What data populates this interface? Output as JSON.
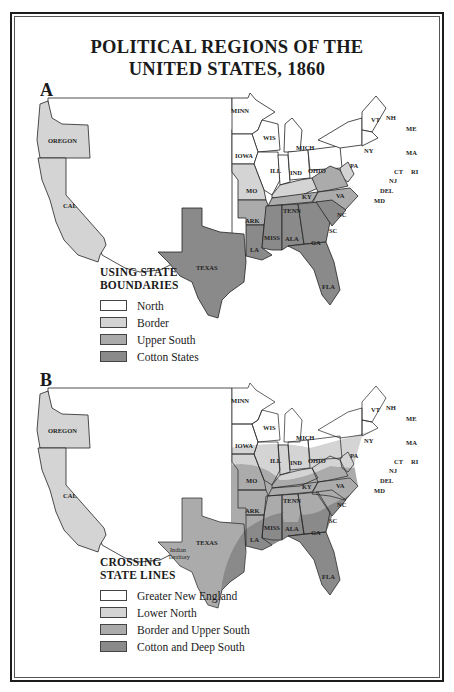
{
  "title": {
    "line1": "POLITICAL REGIONS OF THE",
    "line2": "UNITED STATES, 1860"
  },
  "colors": {
    "north": "#ffffff",
    "border": "#d4d4d4",
    "upper_south": "#ababab",
    "cotton": "#8a8a8a",
    "outline": "#222222",
    "frame": "#1c1c1c"
  },
  "panel_a": {
    "letter": "A",
    "legend": {
      "title_line1": "USING STATE",
      "title_line2": "BOUNDARIES",
      "items": [
        {
          "label": "North",
          "color": "#ffffff"
        },
        {
          "label": "Border",
          "color": "#d4d4d4"
        },
        {
          "label": "Upper South",
          "color": "#ababab"
        },
        {
          "label": "Cotton States",
          "color": "#8a8a8a"
        }
      ]
    },
    "labels": {
      "oregon": "OREGON",
      "cal": "CAL",
      "texas": "TEXAS",
      "minn": "MINN",
      "wis": "WIS",
      "mich": "MICH",
      "iowa": "IOWA",
      "ill": "ILL",
      "ind": "IND",
      "ohio": "OHIO",
      "pa": "PA",
      "ny": "NY",
      "vt": "VT",
      "nh": "NH",
      "me": "ME",
      "ma": "MA",
      "ri": "RI",
      "ct": "CT",
      "nj": "NJ",
      "del": "DEL",
      "md": "MD",
      "mo": "MO",
      "ky": "KY",
      "va": "VA",
      "ark": "ARK",
      "tenn": "TENN",
      "nc": "NC",
      "sc": "SC",
      "la": "LA",
      "miss": "MISS",
      "ala": "ALA",
      "ga": "GA",
      "fla": "FLA"
    }
  },
  "panel_b": {
    "letter": "B",
    "legend": {
      "title_line1": "CROSSING",
      "title_line2": "STATE LINES",
      "items": [
        {
          "label": "Greater New England",
          "color": "#ffffff"
        },
        {
          "label": "Lower North",
          "color": "#d4d4d4"
        },
        {
          "label": "Border and Upper South",
          "color": "#ababab"
        },
        {
          "label": "Cotton and Deep South",
          "color": "#8a8a8a"
        }
      ]
    },
    "labels": {
      "oregon": "OREGON",
      "cal": "CAL",
      "texas": "TEXAS",
      "indian1": "Indian",
      "indian2": "Territory",
      "minn": "MINN",
      "wis": "WIS",
      "mich": "MICH",
      "iowa": "IOWA",
      "ill": "ILL",
      "ind": "IND",
      "ohio": "OHIO",
      "pa": "PA",
      "ny": "NY",
      "vt": "VT",
      "nh": "NH",
      "me": "ME",
      "ma": "MA",
      "ri": "RI",
      "ct": "CT",
      "nj": "NJ",
      "del": "DEL",
      "md": "MD",
      "mo": "MO",
      "ky": "KY",
      "va": "VA",
      "ark": "ARK",
      "tenn": "TENN",
      "nc": "NC",
      "sc": "SC",
      "la": "LA",
      "miss": "MISS",
      "ala": "ALA",
      "ga": "GA",
      "fla": "FLA"
    }
  }
}
